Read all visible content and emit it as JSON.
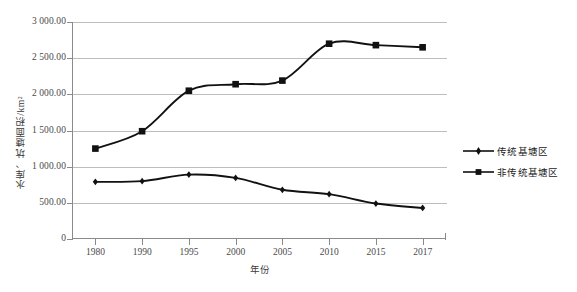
{
  "chart_data": {
    "type": "line",
    "title": "",
    "subtitle": "",
    "xlabel": "年份",
    "ylabel": "水库、坑塘面积/km²",
    "categories": [
      "1980",
      "1990",
      "1995",
      "2000",
      "2005",
      "2010",
      "2015",
      "2017"
    ],
    "x_tick_labels": [
      "1980",
      "1990",
      "1995",
      "2000",
      "2005",
      "2010",
      "2015",
      "2017"
    ],
    "y_tick_labels": [
      "0",
      "500.00",
      "1 000.00",
      "1 500.00",
      "2 000.00",
      "2 500.00",
      "3 000.00"
    ],
    "y_tick_values": [
      0,
      500,
      1000,
      1500,
      2000,
      2500,
      3000
    ],
    "ylim": [
      0,
      3000
    ],
    "grid": "horizontal",
    "legend_position": "right",
    "series": [
      {
        "name": "传统基塘区",
        "marker": "diamond",
        "color": "#111111",
        "values": [
          790,
          800,
          890,
          845,
          680,
          620,
          490,
          430
        ]
      },
      {
        "name": "非传统基塘区",
        "marker": "square",
        "color": "#111111",
        "values": [
          1250,
          1490,
          2050,
          2140,
          2190,
          2700,
          2680,
          2650
        ]
      }
    ]
  },
  "legend": {
    "items": [
      {
        "label": "传统基塘区",
        "marker": "diamond"
      },
      {
        "label": "非传统基塘区",
        "marker": "square"
      }
    ]
  },
  "axes": {
    "y_title": "水库、坑塘面积/km²",
    "x_title": "年份"
  },
  "colors": {
    "series": "#111111",
    "gridline": "#bdbdbd",
    "axis": "#8a8a8a",
    "tick_text": "#4a4a4a",
    "background": "#ffffff"
  }
}
